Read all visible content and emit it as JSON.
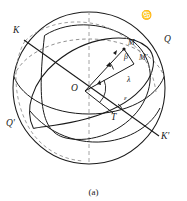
{
  "figure": {
    "caption": "(a)",
    "type": "celestial-sphere-ecliptic-coordinates",
    "stroke_color": "#1a1a1a",
    "dashed_color": "#8a8a8a"
  },
  "labels": {
    "pole_ecliptic_north": "K",
    "pole_ecliptic_south": "K'",
    "equator_point_east": "Q",
    "equator_point_west": "Q'",
    "center": "O",
    "vernal_point": "T",
    "star": "M",
    "star_projection": "M'",
    "latitude_angle": "β",
    "longitude_angle": "λ",
    "obliquity_angle": "ε",
    "solstice_symbol": "♋"
  },
  "label_positions": {
    "pole_ecliptic_north": {
      "x": 13,
      "y": 31
    },
    "pole_ecliptic_south": {
      "x": 160,
      "y": 137
    },
    "equator_point_east": {
      "x": 163,
      "y": 40
    },
    "equator_point_west": {
      "x": 8,
      "y": 124
    },
    "center": {
      "x": 72,
      "y": 88
    },
    "vernal_point": {
      "x": 110,
      "y": 118
    },
    "star": {
      "x": 127,
      "y": 43
    },
    "star_projection": {
      "x": 139,
      "y": 58
    },
    "latitude_angle": {
      "x": 124,
      "y": 56
    },
    "longitude_angle": {
      "x": 127,
      "y": 79
    },
    "obliquity_angle": {
      "x": 124,
      "y": 98
    },
    "solstice_symbol": {
      "x": 141,
      "y": 14
    }
  },
  "geometry": {
    "sphere_center": {
      "x": 89,
      "y": 88
    },
    "sphere_radius": 76,
    "vertical_axis": {
      "x": 89,
      "y1": 12,
      "y2": 164
    },
    "ecliptic_pole_axis": {
      "x1": 25,
      "y1": 41,
      "x2": 158,
      "y2": 135
    },
    "center_point": {
      "x": 85,
      "y": 91
    },
    "star_point": {
      "x": 124,
      "y": 49
    },
    "star_projection_point": {
      "x": 133,
      "y": 64
    },
    "vernal_point_pos": {
      "x": 113,
      "y": 113
    }
  }
}
